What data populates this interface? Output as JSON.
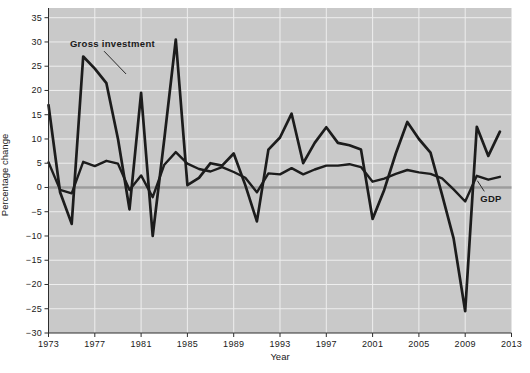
{
  "figure": {
    "background": "#ffffff"
  },
  "chart_data": {
    "type": "line",
    "title": "",
    "xlabel": "Year",
    "ylabel": "Percentage change",
    "x": [
      1973,
      1974,
      1975,
      1976,
      1977,
      1978,
      1979,
      1980,
      1981,
      1982,
      1983,
      1984,
      1985,
      1986,
      1987,
      1988,
      1989,
      1990,
      1991,
      1992,
      1993,
      1994,
      1995,
      1996,
      1997,
      1998,
      1999,
      2000,
      2001,
      2002,
      2003,
      2004,
      2005,
      2006,
      2007,
      2008,
      2009,
      2010,
      2011,
      2012
    ],
    "series": [
      {
        "name": "Gross investment",
        "values": [
          17,
          -1,
          -7.5,
          27,
          24.5,
          21.5,
          10,
          -4.5,
          19.5,
          -10,
          10,
          30.5,
          0.5,
          2,
          5,
          4.5,
          7,
          0.5,
          -7,
          7.8,
          10.3,
          15.2,
          5,
          9.2,
          12.4,
          9.2,
          8.7,
          7.8,
          -6.5,
          -0.5,
          7,
          13.5,
          10,
          7.2,
          -1.5,
          -10.5,
          -25.5,
          12.5,
          6.5,
          11.5
        ],
        "stroke_width": 2.7
      },
      {
        "name": "GDP",
        "values": [
          5.2,
          -0.5,
          -1.2,
          5.3,
          4.4,
          5.5,
          4.9,
          -0.5,
          2.5,
          -2,
          4.7,
          7.3,
          4.9,
          3.8,
          3.3,
          4.2,
          3.2,
          2,
          -1,
          2.9,
          2.7,
          4,
          2.7,
          3.7,
          4.5,
          4.5,
          4.8,
          4.2,
          1.2,
          1.8,
          2.8,
          3.6,
          3.1,
          2.8,
          1.9,
          -0.4,
          -2.9,
          2.4,
          1.6,
          2.2
        ],
        "stroke_width": 2.4
      }
    ],
    "xlim": [
      1973,
      2013
    ],
    "ylim": [
      -30,
      35
    ],
    "ybox_top": 37,
    "xticks": [
      1973,
      1977,
      1981,
      1985,
      1989,
      1993,
      1997,
      2001,
      2005,
      2009,
      2013
    ],
    "xtick_labels": [
      "1973",
      "1977",
      "1981",
      "1985",
      "1989",
      "1993",
      "1997",
      "2001",
      "2005",
      "2009",
      "2013"
    ],
    "yticks": [
      35,
      30,
      25,
      20,
      15,
      10,
      5,
      0,
      -5,
      -10,
      -15,
      -20,
      -25,
      -30
    ],
    "ytick_labels": [
      "35",
      "30",
      "25",
      "20",
      "15",
      "10",
      "5",
      "0",
      "−5",
      "−10",
      "−15",
      "−20",
      "−25",
      "−30"
    ],
    "grid": true,
    "legend_position": "inline-annotations",
    "annotations": [
      {
        "text": "Gross investment",
        "anchor_year": 1974.85,
        "anchor_value": 29.0,
        "pointer": {
          "from": [
            1977.8,
            28.1
          ],
          "to": [
            1979.7,
            23.4
          ]
        }
      },
      {
        "text": "GDP",
        "anchor_year": 2010.3,
        "anchor_value": -3.0,
        "pointer": {
          "from": [
            2010.65,
            -0.8
          ],
          "to": [
            2010.05,
            1.4
          ]
        }
      }
    ],
    "colors": {
      "plot_background": "#c9c9c9",
      "gridline": "#eeeeee",
      "zero_line": "#9c9c9c",
      "series_line": "#1c1c1c",
      "axis_line": "#2e2e2e",
      "text": "#1a1a1a"
    }
  }
}
